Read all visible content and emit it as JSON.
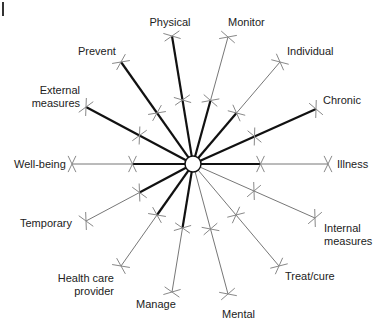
{
  "diagram": {
    "type": "radial-spoke",
    "hub": {
      "x": 193,
      "y": 164,
      "r": 8
    },
    "colors": {
      "thick": "#111111",
      "thin": "#777777",
      "marker": "#888888"
    },
    "spokes": [
      {
        "id": "physical",
        "label": "Physical",
        "end": [
          172,
          36
        ],
        "thick_to": 1.0,
        "label_pos": [
          140,
          16
        ],
        "align": "c",
        "w": 60
      },
      {
        "id": "monitor",
        "label": "Monitor",
        "end": [
          228,
          37
        ],
        "thick_to": 0.5,
        "label_pos": [
          228,
          16
        ],
        "align": "l"
      },
      {
        "id": "individual",
        "label": "Individual",
        "end": [
          280,
          62
        ],
        "thick_to": 0.5,
        "label_pos": [
          287,
          45
        ],
        "align": "l"
      },
      {
        "id": "chronic",
        "label": "Chronic",
        "end": [
          316,
          109
        ],
        "thick_to": 1.0,
        "label_pos": [
          323,
          94
        ],
        "align": "l"
      },
      {
        "id": "illness",
        "label": "Illness",
        "end": [
          328,
          164
        ],
        "thick_to": 0.5,
        "label_pos": [
          337,
          158
        ],
        "align": "l"
      },
      {
        "id": "internal-measures",
        "label": "Internal\nmeasures",
        "end": [
          315,
          218
        ],
        "thick_to": 0.0,
        "label_pos": [
          324,
          222
        ],
        "align": "l"
      },
      {
        "id": "treat-cure",
        "label": "Treat/cure",
        "end": [
          279,
          266
        ],
        "thick_to": 0.0,
        "label_pos": [
          285,
          270
        ],
        "align": "l"
      },
      {
        "id": "mental",
        "label": "Mental",
        "end": [
          228,
          294
        ],
        "thick_to": 0.0,
        "label_pos": [
          222,
          308
        ],
        "align": "l"
      },
      {
        "id": "manage",
        "label": "Manage",
        "end": [
          172,
          292
        ],
        "thick_to": 0.5,
        "label_pos": [
          136,
          298
        ],
        "align": "l"
      },
      {
        "id": "health-care-provider",
        "label": "Health care\nprovider",
        "end": [
          121,
          266
        ],
        "thick_to": 0.5,
        "label_pos": [
          52,
          272
        ],
        "align": "r",
        "w": 62
      },
      {
        "id": "temporary",
        "label": "Temporary",
        "end": [
          86,
          221
        ],
        "thick_to": 0.5,
        "label_pos": [
          20,
          217
        ],
        "align": "l"
      },
      {
        "id": "well-being",
        "label": "Well-being",
        "end": [
          72,
          164
        ],
        "thick_to": 0.5,
        "label_pos": [
          14,
          158
        ],
        "align": "l"
      },
      {
        "id": "external-measures",
        "label": "External\nmeasures",
        "end": [
          86,
          107
        ],
        "thick_to": 1.0,
        "label_pos": [
          24,
          84
        ],
        "align": "r",
        "w": 56
      },
      {
        "id": "prevent",
        "label": "Prevent",
        "end": [
          121,
          62
        ],
        "thick_to": 1.0,
        "label_pos": [
          78,
          45
        ],
        "align": "l"
      }
    ]
  }
}
